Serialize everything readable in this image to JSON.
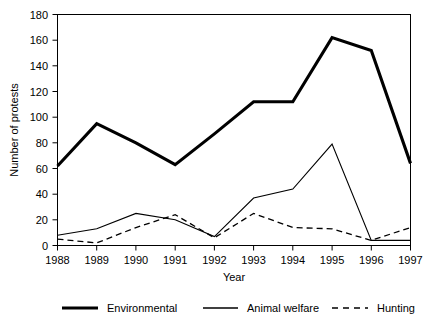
{
  "chart_data": {
    "type": "line",
    "title": "",
    "xlabel": "Year",
    "ylabel": "Number of protests",
    "categories": [
      "1988",
      "1989",
      "1990",
      "1991",
      "1992",
      "1993",
      "1994",
      "1995",
      "1996",
      "1997"
    ],
    "x": [
      1988,
      1989,
      1990,
      1991,
      1992,
      1993,
      1994,
      1995,
      1996,
      1997
    ],
    "xlim": [
      1988,
      1997
    ],
    "ylim": [
      0,
      180
    ],
    "yticks": [
      0,
      20,
      40,
      60,
      80,
      100,
      120,
      140,
      160,
      180
    ],
    "ytick_labels": [
      "0",
      "20",
      "40",
      "60",
      "80",
      "100",
      "120",
      "140",
      "160",
      "180"
    ],
    "grid": false,
    "legend_position": "bottom",
    "series": [
      {
        "name": "Environmental",
        "style": "thick-solid",
        "color": "#000000",
        "values": [
          62,
          95,
          80,
          63,
          87,
          112,
          112,
          162,
          152,
          64
        ]
      },
      {
        "name": "Animal welfare",
        "style": "thin-solid",
        "color": "#000000",
        "values": [
          8,
          13,
          25,
          20,
          7,
          37,
          44,
          79,
          4,
          4
        ]
      },
      {
        "name": "Hunting",
        "style": "dashed",
        "color": "#000000",
        "values": [
          5,
          2,
          14,
          24,
          6,
          25,
          14,
          13,
          4,
          14
        ]
      }
    ]
  },
  "legend": {
    "items": [
      {
        "label": "Environmental",
        "swatch": "thick-solid-line-icon"
      },
      {
        "label": "Animal welfare",
        "swatch": "thin-solid-line-icon"
      },
      {
        "label": "Hunting",
        "swatch": "dashed-line-icon"
      }
    ]
  },
  "axes": {
    "x_title": "Year",
    "y_title": "Number of protests"
  }
}
